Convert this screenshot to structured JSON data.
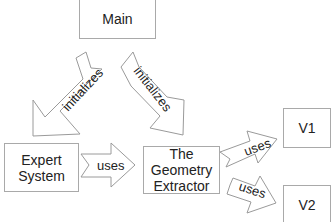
{
  "diagram": {
    "type": "flow",
    "colors": {
      "border": "#a9a9a9",
      "arrow_stroke": "#9a9a9a",
      "fill": "#ffffff",
      "text": "#222222"
    },
    "nodes": [
      {
        "id": "main",
        "label": "Main"
      },
      {
        "id": "expert_system",
        "label": "Expert\nSystem"
      },
      {
        "id": "geometry_extractor",
        "label": "The\nGeometry\nExtractor"
      },
      {
        "id": "v1",
        "label": "V1"
      },
      {
        "id": "v2",
        "label": "V2"
      }
    ],
    "edges": [
      {
        "from": "main",
        "to": "expert_system",
        "label": "initializes"
      },
      {
        "from": "main",
        "to": "geometry_extractor",
        "label": "initializes"
      },
      {
        "from": "expert_system",
        "to": "geometry_extractor",
        "label": "uses"
      },
      {
        "from": "geometry_extractor",
        "to": "v1",
        "label": "uses"
      },
      {
        "from": "geometry_extractor",
        "to": "v2",
        "label": "uses"
      }
    ]
  }
}
